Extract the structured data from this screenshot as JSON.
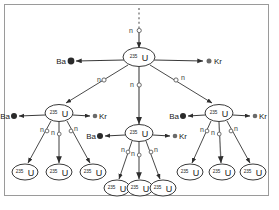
{
  "figure": {
    "type": "nuclear-fission-chain-reaction-diagram",
    "background_color": "#ffffff",
    "border_color": "#9a9a9a",
    "line_color": "#4a4a4a",
    "text_color": "#1a1a1a"
  },
  "labels": {
    "uranium_superscript": "235",
    "uranium_symbol": "U",
    "barium_symbol": "Ba",
    "krypton_symbol": "Kr",
    "neutron_symbol": "n"
  },
  "generations": [
    {
      "index": 0,
      "name": "initiating-neutron",
      "neutron_count": 1,
      "nuclei": []
    },
    {
      "index": 1,
      "name": "first-generation",
      "nuclei": [
        {
          "id": "u1",
          "x": 139,
          "y": 57,
          "products": [
            "Ba",
            "Kr"
          ],
          "neutrons_emitted": 3
        }
      ]
    },
    {
      "index": 2,
      "name": "second-generation",
      "nuclei": [
        {
          "id": "u2a",
          "x": 59,
          "y": 113,
          "products": [
            "Ba",
            "Kr"
          ],
          "neutrons_emitted": 3
        },
        {
          "id": "u2b",
          "x": 139,
          "y": 133,
          "products": [
            "Ba",
            "Kr"
          ],
          "neutrons_emitted": 3
        },
        {
          "id": "u2c",
          "x": 219,
          "y": 113,
          "products": [
            "Ba",
            "Kr"
          ],
          "neutrons_emitted": 3
        }
      ]
    },
    {
      "index": 3,
      "name": "third-generation",
      "nuclei": [
        {
          "id": "u3a",
          "x": 25,
          "y": 172
        },
        {
          "id": "u3b",
          "x": 59,
          "y": 172
        },
        {
          "id": "u3c",
          "x": 93,
          "y": 172
        },
        {
          "id": "u3d",
          "x": 117,
          "y": 188
        },
        {
          "id": "u3e",
          "x": 140,
          "y": 188
        },
        {
          "id": "u3f",
          "x": 163,
          "y": 188
        },
        {
          "id": "u3g",
          "x": 190,
          "y": 172
        },
        {
          "id": "u3h",
          "x": 222,
          "y": 172
        },
        {
          "id": "u3i",
          "x": 253,
          "y": 172
        }
      ]
    }
  ],
  "counts": {
    "total_uranium_nuclei": 13,
    "total_barium_products": 4,
    "total_krypton_products": 4,
    "total_neutron_markers": 13
  }
}
